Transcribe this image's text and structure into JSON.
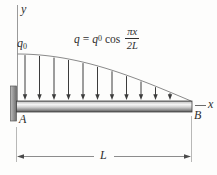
{
  "figure": {
    "type": "cantilever-beam-with-cosine-distributed-load",
    "labels": {
      "y_axis": "y",
      "x_axis": "x",
      "support_point": "A",
      "free_end_point": "B",
      "span_length": "L",
      "peak_load": {
        "base": "q",
        "sub": "0"
      }
    },
    "equation": {
      "lhs": "q",
      "equals": "=",
      "coeff_base": "q",
      "coeff_sub": "0",
      "function": "cos",
      "frac_numerator": "πx",
      "frac_denominator": "2L"
    },
    "diagram": {
      "arrow_count": 11,
      "colors": {
        "axis": "#8f8f8f",
        "line": "#4a4a4a",
        "arrow": "#3c3c3c",
        "curve": "#8a8a8a",
        "dim": "#6f6f6f",
        "ext": "#9a9a9a",
        "beam_stroke": "#3f3f3f",
        "support_stroke": "#5a5a5a"
      }
    }
  }
}
